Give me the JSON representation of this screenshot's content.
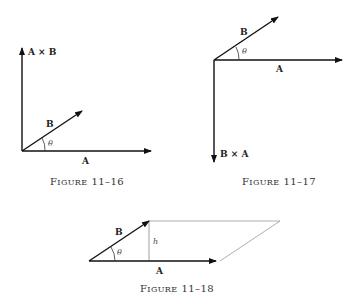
{
  "figures": [
    {
      "caption_prefix": "F",
      "caption_rest": "IGURE",
      "caption_num": "11–16",
      "labels": {
        "up": "A × B",
        "b": "B",
        "a": "A",
        "angle": "θ"
      }
    },
    {
      "caption_prefix": "F",
      "caption_rest": "IGURE",
      "caption_num": "11–17",
      "labels": {
        "down": "B × A",
        "b": "B",
        "a": "A",
        "angle": "θ"
      }
    },
    {
      "caption_prefix": "F",
      "caption_rest": "IGURE",
      "caption_num": "11–18",
      "labels": {
        "b": "B",
        "a": "A",
        "height": "h",
        "angle": "θ"
      }
    }
  ]
}
